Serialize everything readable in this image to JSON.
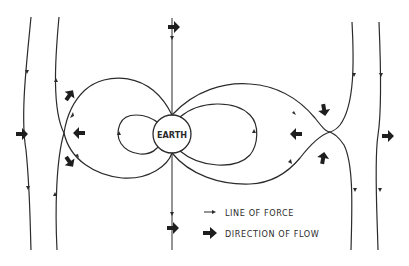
{
  "diagram": {
    "center_label": "EARTH",
    "legend": {
      "items": [
        {
          "symbol": "small-arrow",
          "label": "LINE OF FORCE"
        },
        {
          "symbol": "bold-arrow",
          "label": "DIRECTION OF FLOW"
        }
      ]
    },
    "colors": {
      "line": "#2b2b2b",
      "arrow": "#1e1e1e",
      "background": "#ffffff"
    }
  }
}
